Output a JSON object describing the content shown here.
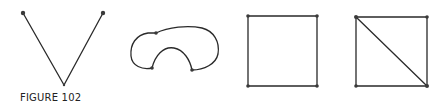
{
  "figure": {
    "caption": "FIGURE 102",
    "stroke_color": "#2a2a2a",
    "vertex_color": "#3a3a3a",
    "graphs": [
      {
        "name": "v-shape",
        "vertices": [
          [
            23,
            13
          ],
          [
            64,
            85
          ],
          [
            103,
            13
          ]
        ],
        "edges": [
          [
            0,
            1
          ],
          [
            1,
            2
          ]
        ]
      },
      {
        "name": "closed-curve",
        "vertices": [
          [
            156,
            33
          ],
          [
            152,
            68
          ],
          [
            192,
            70
          ]
        ],
        "description": "single closed curve passing through three vertices, kidney shape"
      },
      {
        "name": "square",
        "vertices": [
          [
            248,
            16
          ],
          [
            317,
            16
          ],
          [
            317,
            86
          ],
          [
            248,
            86
          ]
        ],
        "edges": [
          [
            0,
            1
          ],
          [
            1,
            2
          ],
          [
            2,
            3
          ],
          [
            3,
            0
          ]
        ]
      },
      {
        "name": "square-with-diagonal",
        "vertices": [
          [
            356,
            17
          ],
          [
            427,
            17
          ],
          [
            427,
            86
          ],
          [
            356,
            86
          ]
        ],
        "edges": [
          [
            0,
            1
          ],
          [
            1,
            2
          ],
          [
            2,
            3
          ],
          [
            3,
            0
          ],
          [
            0,
            2
          ]
        ]
      }
    ]
  }
}
